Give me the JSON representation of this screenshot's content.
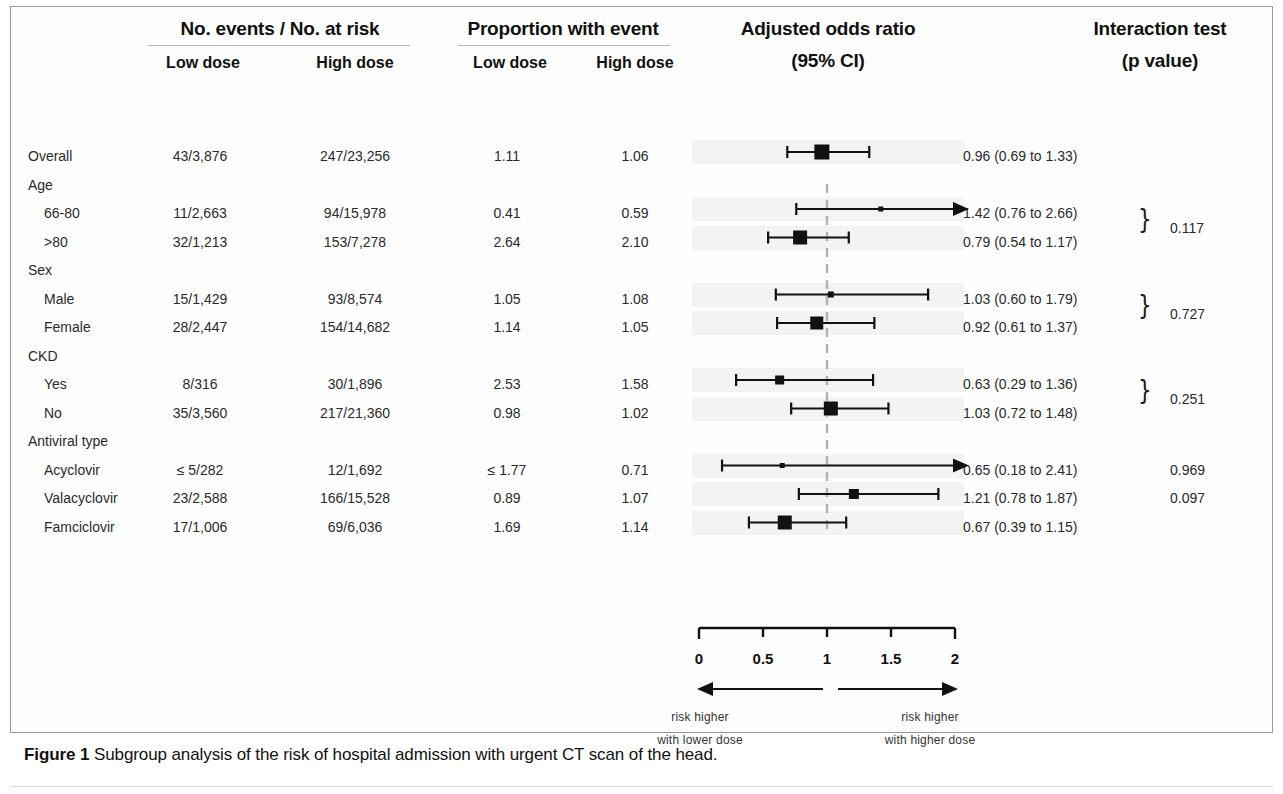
{
  "figure": {
    "caption_bold": "Figure 1",
    "caption_text": "Subgroup analysis of the risk of hospital admission with urgent CT scan of the head."
  },
  "headers": {
    "events_group": "No. events / No. at risk",
    "proportion_group": "Proportion with event",
    "or_group_line1": "Adjusted odds ratio",
    "or_group_line2": "(95% CI)",
    "interaction_line1": "Interaction test",
    "interaction_line2": "(p value)",
    "events_low": "Low dose",
    "events_high": "High dose",
    "prop_low": "Low dose",
    "prop_high": "High dose"
  },
  "axis": {
    "ticks": [
      "0",
      "0.5",
      "1",
      "1.5",
      "2"
    ],
    "tick_values": [
      0,
      0.5,
      1,
      1.5,
      2
    ],
    "min": 0,
    "max": 2,
    "reference_line": 1,
    "left_arrow_line1": "risk higher",
    "left_arrow_line2": "with lower dose",
    "right_arrow_line1": "risk higher",
    "right_arrow_line2": "with higher dose"
  },
  "colors": {
    "marker": "#111111",
    "line": "#111111",
    "band": "#f4f3f1",
    "text": "#2a2a2a",
    "reference_dash": "#b2b2b2"
  },
  "chart_data": {
    "type": "forest",
    "title": "Subgroup analysis of the risk of hospital admission with urgent CT scan of the head",
    "xlabel": "Adjusted odds ratio (95% CI)",
    "xlim": [
      0,
      2
    ],
    "xticks": [
      0,
      0.5,
      1,
      1.5,
      2
    ],
    "reference_line": 1,
    "grid": false,
    "rows": [
      {
        "type": "data",
        "label": "Overall",
        "indent": 0,
        "events_low": "43/3,876",
        "events_high": "247/23,256",
        "prop_low": "1.11",
        "prop_high": "1.06",
        "or": 0.96,
        "ci_low": 0.69,
        "ci_high": 1.33,
        "or_text": "0.96 (0.69 to 1.33)",
        "marker_size": 15,
        "arrow_right": false,
        "p_value": ""
      },
      {
        "type": "group",
        "label": "Age",
        "indent": 0
      },
      {
        "type": "data",
        "label": "66-80",
        "indent": 1,
        "events_low": "11/2,663",
        "events_high": "94/15,978",
        "prop_low": "0.41",
        "prop_high": "0.59",
        "or": 1.42,
        "ci_low": 0.76,
        "ci_high": 2.66,
        "or_text": "1.42 (0.76 to 2.66)",
        "marker_size": 5,
        "arrow_right": true,
        "p_value": ""
      },
      {
        "type": "data",
        "label": ">80",
        "indent": 1,
        "events_low": "32/1,213",
        "events_high": "153/7,278",
        "prop_low": "2.64",
        "prop_high": "2.10",
        "or": 0.79,
        "ci_low": 0.54,
        "ci_high": 1.17,
        "or_text": "0.79 (0.54 to 1.17)",
        "marker_size": 14,
        "arrow_right": false,
        "p_value": ""
      },
      {
        "type": "group",
        "label": "Sex",
        "indent": 0
      },
      {
        "type": "data",
        "label": "Male",
        "indent": 1,
        "events_low": "15/1,429",
        "events_high": "93/8,574",
        "prop_low": "1.05",
        "prop_high": "1.08",
        "or": 1.03,
        "ci_low": 0.6,
        "ci_high": 1.79,
        "or_text": "1.03 (0.60 to 1.79)",
        "marker_size": 6,
        "arrow_right": false,
        "p_value": ""
      },
      {
        "type": "data",
        "label": "Female",
        "indent": 1,
        "events_low": "28/2,447",
        "events_high": "154/14,682",
        "prop_low": "1.14",
        "prop_high": "1.05",
        "or": 0.92,
        "ci_low": 0.61,
        "ci_high": 1.37,
        "or_text": "0.92 (0.61 to 1.37)",
        "marker_size": 13,
        "arrow_right": false,
        "p_value": ""
      },
      {
        "type": "group",
        "label": "CKD",
        "indent": 0
      },
      {
        "type": "data",
        "label": "Yes",
        "indent": 1,
        "events_low": "8/316",
        "events_high": "30/1,896",
        "prop_low": "2.53",
        "prop_high": "1.58",
        "or": 0.63,
        "ci_low": 0.29,
        "ci_high": 1.36,
        "or_text": "0.63 (0.29 to 1.36)",
        "marker_size": 9,
        "arrow_right": false,
        "p_value": ""
      },
      {
        "type": "data",
        "label": "No",
        "indent": 1,
        "events_low": "35/3,560",
        "events_high": "217/21,360",
        "prop_low": "0.98",
        "prop_high": "1.02",
        "or": 1.03,
        "ci_low": 0.72,
        "ci_high": 1.48,
        "or_text": "1.03 (0.72 to 1.48)",
        "marker_size": 14,
        "arrow_right": false,
        "p_value": ""
      },
      {
        "type": "group",
        "label": "Antiviral type",
        "indent": 0
      },
      {
        "type": "data",
        "label": "Acyclovir",
        "indent": 1,
        "events_low": "≤ 5/282",
        "events_high": "12/1,692",
        "prop_low": "≤ 1.77",
        "prop_high": "0.71",
        "or": 0.65,
        "ci_low": 0.18,
        "ci_high": 2.41,
        "or_text": "0.65 (0.18 to 2.41)",
        "marker_size": 5,
        "arrow_right": true,
        "p_value": "0.969"
      },
      {
        "type": "data",
        "label": "Valacyclovir",
        "indent": 1,
        "events_low": "23/2,588",
        "events_high": "166/15,528",
        "prop_low": "0.89",
        "prop_high": "1.07",
        "or": 1.21,
        "ci_low": 0.78,
        "ci_high": 1.87,
        "or_text": "1.21 (0.78 to 1.87)",
        "marker_size": 10,
        "arrow_right": false,
        "p_value": "0.097"
      },
      {
        "type": "data",
        "label": "Famciclovir",
        "indent": 1,
        "events_low": "17/1,006",
        "events_high": "69/6,036",
        "prop_low": "1.69",
        "prop_high": "1.14",
        "or": 0.67,
        "ci_low": 0.39,
        "ci_high": 1.15,
        "or_text": "0.67 (0.39 to 1.15)",
        "marker_size": 14,
        "arrow_right": false,
        "p_value": ""
      }
    ],
    "interaction_braces": [
      {
        "p_value": "0.117",
        "rows": [
          "66-80",
          ">80"
        ]
      },
      {
        "p_value": "0.727",
        "rows": [
          "Male",
          "Female"
        ]
      },
      {
        "p_value": "0.251",
        "rows": [
          "Yes",
          "No"
        ]
      }
    ]
  }
}
